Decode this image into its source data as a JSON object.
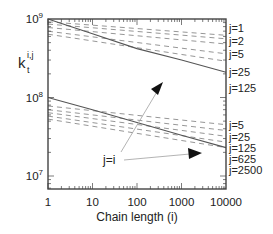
{
  "chart_data": {
    "type": "line",
    "title": "",
    "xlabel": "Chain length (i)",
    "ylabel": "k_t^{i,j}",
    "ylabel_main": "k",
    "ylabel_sub": "t",
    "ylabel_sup": "i,j",
    "xscale": "log",
    "yscale": "log",
    "xlim": [
      1,
      10000
    ],
    "ylim": [
      7000000,
      1000000000
    ],
    "x_ticks": [
      "1",
      "10",
      "100",
      "1000",
      "10000"
    ],
    "y_ticks": [
      {
        "base": "10",
        "exp": "9"
      },
      {
        "base": "10",
        "exp": "8"
      },
      {
        "base": "10",
        "exp": "7"
      }
    ],
    "grid": false,
    "series": [
      {
        "group": "upper",
        "name": "j=1",
        "style": "dashed",
        "x": [
          1,
          10000
        ],
        "y": [
          920000000,
          620000000
        ]
      },
      {
        "group": "upper",
        "name": "j=2",
        "style": "dashed",
        "x": [
          1,
          10000
        ],
        "y": [
          860000000,
          560000000
        ]
      },
      {
        "group": "upper",
        "name": "j=5",
        "style": "dashed",
        "x": [
          1,
          10000
        ],
        "y": [
          780000000,
          480000000
        ]
      },
      {
        "group": "upper",
        "name": "j=25",
        "style": "dashed",
        "x": [
          1,
          10000
        ],
        "y": [
          700000000,
          360000000
        ]
      },
      {
        "group": "upper",
        "name": "j=125",
        "style": "dashed",
        "x": [
          1,
          10000
        ],
        "y": [
          640000000,
          290000000
        ]
      },
      {
        "group": "upper",
        "name": "j=i",
        "style": "solid",
        "x": [
          1,
          10,
          100,
          1000,
          10000
        ],
        "y": [
          1000000000,
          650000000,
          420000000,
          300000000,
          210000000
        ]
      },
      {
        "group": "lower",
        "name": "j=5",
        "style": "dashed",
        "x": [
          1,
          10000
        ],
        "y": [
          78000000,
          45000000
        ]
      },
      {
        "group": "lower",
        "name": "j=25",
        "style": "dashed",
        "x": [
          1,
          10000
        ],
        "y": [
          70000000,
          38000000
        ]
      },
      {
        "group": "lower",
        "name": "j=125",
        "style": "dashed",
        "x": [
          1,
          10000
        ],
        "y": [
          64000000,
          32000000
        ]
      },
      {
        "group": "lower",
        "name": "j=625",
        "style": "dashed",
        "x": [
          1,
          10000
        ],
        "y": [
          58000000,
          27000000
        ]
      },
      {
        "group": "lower",
        "name": "j=2500",
        "style": "dashed",
        "x": [
          1,
          10000
        ],
        "y": [
          53000000,
          23000000
        ]
      },
      {
        "group": "lower",
        "name": "j=i",
        "style": "solid",
        "x": [
          1,
          10,
          100,
          1000,
          10000
        ],
        "y": [
          100000000,
          70000000,
          48000000,
          33000000,
          23000000
        ]
      }
    ],
    "right_labels_upper": [
      "j=1",
      "j=2",
      "j=5",
      "j=25",
      "j=125"
    ],
    "right_labels_lower": [
      "j=5",
      "j=25",
      "j=125",
      "j=625",
      "j=2500"
    ],
    "annotations": [
      {
        "text": "j=i",
        "arrows_to": [
          "upper solid curve",
          "lower solid curve"
        ]
      }
    ]
  },
  "colors": {
    "axis": "#444444",
    "solid_line": "#555555",
    "dashed_line": "#8a8a8a",
    "arrow": "#aaaaaa",
    "arrow_head": "#111111",
    "text": "#222222"
  }
}
